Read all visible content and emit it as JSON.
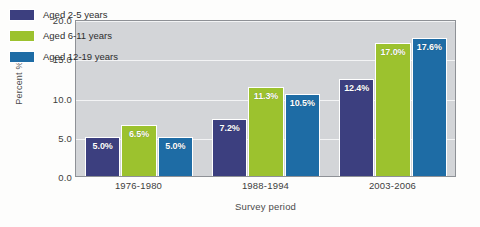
{
  "chart_data": {
    "type": "bar",
    "title": "",
    "xlabel": "Survey period",
    "ylabel": "Percent %",
    "categories": [
      "1976-1980",
      "1988-1994",
      "2003-2006"
    ],
    "series": [
      {
        "name": "Aged 2-5 years",
        "color": "#3c3f7f",
        "values": [
          5.0,
          7.2,
          12.4
        ],
        "labels": [
          "5.0%",
          "7.2%",
          "12.4%"
        ]
      },
      {
        "name": "Aged 6-11 years",
        "color": "#9cc22e",
        "values": [
          6.5,
          11.3,
          17.0
        ],
        "labels": [
          "6.5%",
          "11.3%",
          "17.0%"
        ]
      },
      {
        "name": "Aged 12-19 years",
        "color": "#1e6ca5",
        "values": [
          5.0,
          10.5,
          17.6
        ],
        "labels": [
          "5.0%",
          "10.5%",
          "17.6%"
        ]
      }
    ],
    "ylim": [
      0.0,
      20.0
    ],
    "yticks": [
      "0.0",
      "5.0",
      "10.0",
      "15.0",
      "20.0"
    ],
    "ytick_values": [
      0.0,
      5.0,
      10.0,
      15.0,
      20.0
    ],
    "grid": true,
    "legend_position": "top-left",
    "plot_background": "#d3d5d8",
    "gridline_color": "#f3f4f5"
  }
}
